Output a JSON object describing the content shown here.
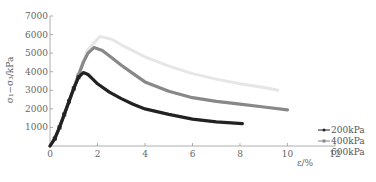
{
  "chart_data": {
    "type": "line",
    "title": "",
    "xlabel": "ε/%",
    "ylabel": "σ₁−σ₃/kPa",
    "xlim": [
      0,
      12
    ],
    "ylim": [
      0,
      7000
    ],
    "xticks": [
      "0",
      "2",
      "4",
      "6",
      "8",
      "10",
      "12"
    ],
    "yticks": [
      "1000",
      "2000",
      "3000",
      "4000",
      "5000",
      "6000",
      "7000"
    ],
    "grid": false,
    "legend_position": "right",
    "series": [
      {
        "name": "200kPa",
        "color": "#222222",
        "marker": "diamond",
        "x": [
          0,
          0.2,
          0.4,
          0.6,
          0.8,
          1.0,
          1.2,
          1.4,
          1.6,
          1.8,
          2.0,
          2.5,
          3.0,
          3.5,
          4.0,
          5.0,
          6.0,
          7.0,
          8.1
        ],
        "y": [
          0,
          400,
          1000,
          1700,
          2400,
          3100,
          3700,
          3950,
          3850,
          3600,
          3350,
          2900,
          2550,
          2250,
          2000,
          1700,
          1450,
          1300,
          1200
        ]
      },
      {
        "name": "400kPa",
        "color": "#888888",
        "marker": "square",
        "x": [
          0,
          0.2,
          0.4,
          0.6,
          0.8,
          1.0,
          1.2,
          1.4,
          1.6,
          1.85,
          2.2,
          2.6,
          3.0,
          3.5,
          4.0,
          5.0,
          6.0,
          7.0,
          8.0,
          9.0,
          10.0
        ],
        "y": [
          0,
          400,
          1000,
          1700,
          2400,
          3100,
          3800,
          4500,
          5000,
          5300,
          5150,
          4750,
          4350,
          3900,
          3450,
          2950,
          2600,
          2400,
          2250,
          2100,
          1950
        ]
      },
      {
        "name": "600kPa",
        "color": "#e6e6e6",
        "marker": "none",
        "x": [
          0,
          0.4,
          0.8,
          1.2,
          1.6,
          2.1,
          2.6,
          3.0,
          4.0,
          5.0,
          6.0,
          7.0,
          8.0,
          9.0,
          9.6
        ],
        "y": [
          0,
          1000,
          2400,
          3900,
          5200,
          5900,
          5750,
          5450,
          4800,
          4300,
          3900,
          3600,
          3350,
          3150,
          3000
        ]
      }
    ]
  },
  "legend": {
    "items": [
      "200kPa",
      "400kPa",
      "600kPa"
    ]
  },
  "axes": {
    "xlabel": "ε/%",
    "ylabel": "σ₁−σ₃/kPa"
  }
}
